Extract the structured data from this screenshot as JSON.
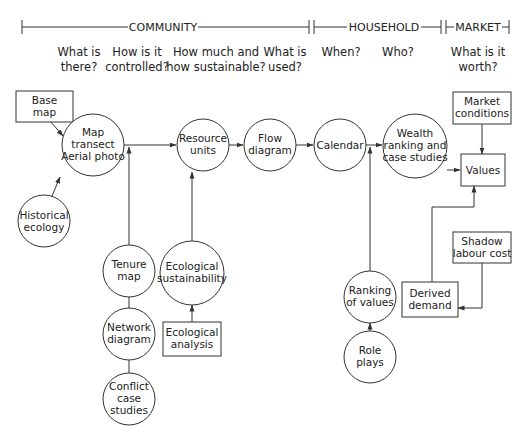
{
  "header": {
    "sections": [
      {
        "label": "COMMUNITY"
      },
      {
        "label": "HOUSEHOLD"
      },
      {
        "label": "MARKET"
      }
    ]
  },
  "questions": [
    {
      "line1": "What is",
      "line2": "there?"
    },
    {
      "line1": "How is it",
      "line2": "controlled?"
    },
    {
      "line1": "How much and",
      "line2": "how sustainable?"
    },
    {
      "line1": "What is",
      "line2": "used?"
    },
    {
      "line1": "When?",
      "line2": ""
    },
    {
      "line1": "Who?",
      "line2": ""
    },
    {
      "line1": "What is it",
      "line2": "worth?"
    }
  ],
  "nodes": {
    "base_map": {
      "shape": "box",
      "lines": [
        "Base",
        "map"
      ]
    },
    "map_transect": {
      "shape": "circle",
      "lines": [
        "Map",
        "transect",
        "Aerial photo"
      ]
    },
    "historical_ecology": {
      "shape": "circle",
      "lines": [
        "Historical",
        "ecology"
      ]
    },
    "resource_units": {
      "shape": "circle",
      "lines": [
        "Resource",
        "units"
      ]
    },
    "flow_diagram": {
      "shape": "circle",
      "lines": [
        "Flow",
        "diagram"
      ]
    },
    "calendar": {
      "shape": "circle",
      "lines": [
        "Calendar"
      ]
    },
    "wealth_ranking": {
      "shape": "circle",
      "lines": [
        "Wealth",
        "ranking and",
        "case studies"
      ]
    },
    "values": {
      "shape": "box",
      "lines": [
        "Values"
      ]
    },
    "market_conditions": {
      "shape": "box",
      "lines": [
        "Market",
        "conditions"
      ]
    },
    "shadow_labour_cost": {
      "shape": "box",
      "lines": [
        "Shadow",
        "labour cost"
      ]
    },
    "derived_demand": {
      "shape": "box",
      "lines": [
        "Derived",
        "demand"
      ]
    },
    "tenure_map": {
      "shape": "circle",
      "lines": [
        "Tenure",
        "map"
      ]
    },
    "network_diagram": {
      "shape": "circle",
      "lines": [
        "Network",
        "diagram"
      ]
    },
    "conflict_case_studies": {
      "shape": "circle",
      "lines": [
        "Conflict",
        "case",
        "studies"
      ]
    },
    "ecological_sustainability": {
      "shape": "circle",
      "lines": [
        "Ecological",
        "sustainability"
      ]
    },
    "ecological_analysis": {
      "shape": "box",
      "lines": [
        "Ecological",
        "analysis"
      ]
    },
    "ranking_of_values": {
      "shape": "circle",
      "lines": [
        "Ranking",
        "of values"
      ]
    },
    "role_plays": {
      "shape": "circle",
      "lines": [
        "Role",
        "plays"
      ]
    }
  },
  "edges": [
    {
      "from": "base_map",
      "to": "map_transect"
    },
    {
      "from": "historical_ecology",
      "to": "map_transect"
    },
    {
      "from": "map_transect",
      "to": "resource_units"
    },
    {
      "from": "tenure_map",
      "to": "resource_units"
    },
    {
      "from": "ecological_sustainability",
      "to": "resource_units"
    },
    {
      "from": "resource_units",
      "to": "flow_diagram"
    },
    {
      "from": "flow_diagram",
      "to": "calendar"
    },
    {
      "from": "calendar",
      "to": "wealth_ranking"
    },
    {
      "from": "ranking_of_values",
      "to": "wealth_ranking"
    },
    {
      "from": "wealth_ranking",
      "to": "values"
    },
    {
      "from": "market_conditions",
      "to": "values"
    },
    {
      "from": "derived_demand",
      "to": "values"
    },
    {
      "from": "shadow_labour_cost",
      "to": "derived_demand"
    },
    {
      "from": "ecological_analysis",
      "to": "ecological_sustainability"
    },
    {
      "from": "role_plays",
      "to": "ranking_of_values"
    },
    {
      "from": "tenure_map",
      "to": "network_diagram",
      "arrow": false
    },
    {
      "from": "network_diagram",
      "to": "conflict_case_studies",
      "arrow": false
    }
  ]
}
